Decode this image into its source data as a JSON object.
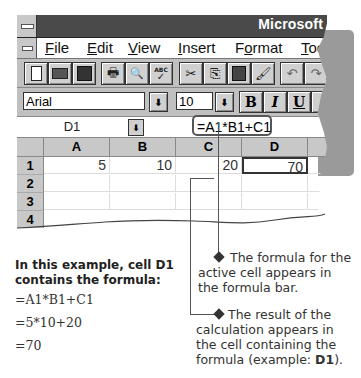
{
  "window": {
    "title": "Microsoft"
  },
  "menu": {
    "items": [
      {
        "label": "File",
        "u": "F",
        "rest": "ile"
      },
      {
        "label": "Edit",
        "u": "E",
        "rest": "dit"
      },
      {
        "label": "View",
        "u": "V",
        "rest": "iew"
      },
      {
        "label": "Insert",
        "u": "I",
        "rest": "nsert"
      },
      {
        "label": "Format",
        "pre": "F",
        "u": "o",
        "rest": "rmat"
      },
      {
        "label": "Tools",
        "u": "T",
        "rest": "ool"
      }
    ]
  },
  "toolbar": {
    "buttons": [
      "new",
      "open",
      "save",
      "print",
      "print-preview",
      "spelling",
      "cut",
      "copy",
      "paste",
      "format-painter",
      "undo",
      "redo"
    ],
    "glyphs": {
      "new": "🗋",
      "open": "📂",
      "save": "💾",
      "print": "🖶",
      "print_preview": "🔍",
      "spelling": "ABC✓",
      "cut": "✂",
      "copy": "⎘",
      "paste": "📋",
      "format_painter": "🖌",
      "undo": "↶",
      "redo": "↷"
    }
  },
  "formatting": {
    "font": "Arial",
    "size": "10",
    "bold": "B",
    "italic": "I",
    "underline": "U",
    "dropdown_arrow": "⬇"
  },
  "formula_bar": {
    "name_box": "D1",
    "formula": "=A1*B1+C1"
  },
  "grid": {
    "columns": [
      "A",
      "B",
      "C",
      "D"
    ],
    "rows": [
      "1",
      "2",
      "3",
      "4"
    ],
    "cells": {
      "A1": "5",
      "B1": "10",
      "C1": "20",
      "D1": "70"
    },
    "active_cell": "D1"
  },
  "example": {
    "heading_line1": "In this example, cell D1",
    "heading_line2": "contains the formula:",
    "steps": [
      "=A1*B1+C1",
      "=5*10+20",
      "=70"
    ]
  },
  "callouts": [
    {
      "lines": [
        "The formula for the",
        "active cell appears in",
        "the formula bar."
      ]
    },
    {
      "lines": [
        "The result of the",
        "calculation appears in",
        "the cell containing the"
      ],
      "last_prefix": "formula (example: ",
      "last_bold": "D1",
      "last_suffix": ")."
    }
  ]
}
